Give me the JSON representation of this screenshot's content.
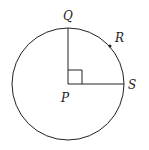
{
  "labels": {
    "Q": "Q",
    "R": "R",
    "S": "S",
    "P": "P"
  },
  "geometry": {
    "center": [
      68,
      84
    ],
    "radius": 56,
    "right_angle_marker": true
  },
  "colors": {
    "stroke": "#222222",
    "background": "#ffffff"
  }
}
